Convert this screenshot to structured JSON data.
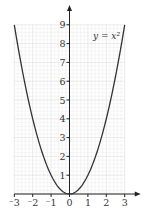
{
  "chart_data": {
    "type": "line",
    "title": "",
    "annotation": "y = x²",
    "series": [
      {
        "name": "y = x²",
        "x": [
          -3,
          -2.5,
          -2,
          -1.5,
          -1,
          -0.5,
          0,
          0.5,
          1,
          1.5,
          2,
          2.5,
          3
        ],
        "values": [
          9,
          6.25,
          4,
          2.25,
          1,
          0.25,
          0,
          0.25,
          1,
          2.25,
          4,
          6.25,
          9
        ]
      }
    ],
    "xlabel": "",
    "ylabel": "",
    "xlim": [
      -3,
      3
    ],
    "ylim": [
      0,
      9
    ],
    "x_ticks": [
      "-3",
      "-2",
      "-1",
      "0",
      "1",
      "2",
      "3"
    ],
    "y_ticks": [
      "1",
      "2",
      "3",
      "4",
      "5",
      "6",
      "7",
      "8",
      "9"
    ],
    "grid": true,
    "colors": {
      "curve": "#333333",
      "axis": "#222222",
      "grid": "#e6e6e6"
    }
  }
}
